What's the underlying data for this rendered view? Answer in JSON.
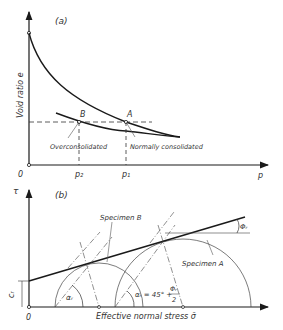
{
  "panel_a": {
    "label": "(a)",
    "y_axis_label": "Void ratio  e",
    "x_axis_label": "p",
    "origin_label": "0",
    "point_b": "B",
    "point_a": "A",
    "tick_p2": "p₂",
    "tick_p1": "p₁",
    "annotation_overconsolidated": "Overconsolidated",
    "annotation_normally": "Normally consolidated"
  },
  "panel_b": {
    "label": "(b)",
    "y_axis_label": "τ",
    "x_axis_label": "Effective normal stress  σ̄",
    "origin_label": "0",
    "cohesion_label": "cᵣ",
    "specimen_b": "Specimen B",
    "specimen_a": "Specimen A",
    "alpha_r": "αᵣ",
    "alpha_formula": "αᵣ = 45° +",
    "phi_frac_num": "Φᵣ",
    "phi_frac_den": "2",
    "phi_r": "Φᵣ"
  },
  "colors": {
    "line": "#1a1a1a",
    "thin": "#444444",
    "text": "#333333"
  }
}
